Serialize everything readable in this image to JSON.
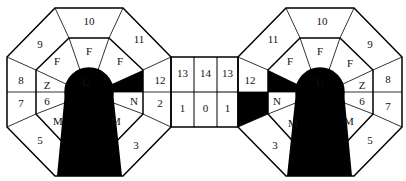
{
  "diagram": {
    "left_octagon": {
      "outer_labels": {
        "top": "10",
        "top_left": "9",
        "top_right": "11",
        "left_upper": "8",
        "left_lower": "7",
        "bottom_left": "5",
        "right_upper": "12",
        "right_lower": "2",
        "bottom_right": "3"
      },
      "inner_labels": {
        "top": "F",
        "top_left": "F",
        "top_right": "F",
        "left_upper": "Z",
        "left_lower": "6",
        "bottom_left": "M",
        "right_lower": "N",
        "bottom_right": "M"
      },
      "center_label": "U"
    },
    "bridge": {
      "top_row": [
        "13",
        "14",
        "13"
      ],
      "bottom_row": [
        "1",
        "0",
        "1"
      ]
    },
    "right_octagon": {
      "outer_labels": {
        "top": "10",
        "top_left": "11",
        "top_right": "9",
        "left_upper": "12",
        "right_upper": "8",
        "right_lower": "7",
        "bottom_left": "3",
        "bottom_right": "5"
      },
      "inner_labels": {
        "top": "F",
        "top_left": "F",
        "top_right": "F",
        "right_upper": "Z",
        "right_lower": "6",
        "left_lower": "N",
        "bottom_left": "M",
        "bottom_right": "M"
      },
      "center_label": "U"
    },
    "colors": {
      "line": "#000000",
      "fill": "#000000",
      "background": "#ffffff"
    }
  }
}
